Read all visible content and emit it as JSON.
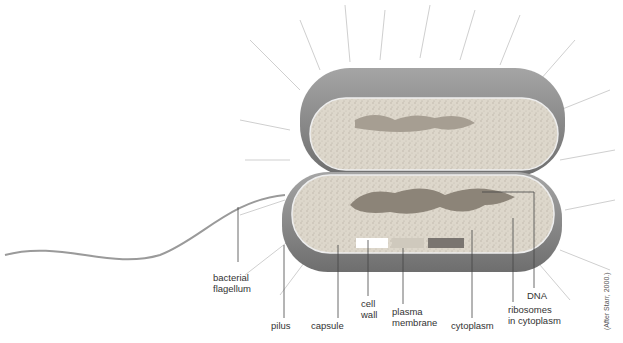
{
  "figure": {
    "credit": "(After Starr, 2000.)",
    "colors": {
      "capsule": "#8a8a8a",
      "cytoplasm": "#d6d0c4",
      "dna": "#8c8478",
      "pili": "#c8c8c8",
      "label_lines": "#444444"
    }
  },
  "labels": {
    "flagellum": "bacterial flagellum",
    "flagellum_l1": "bacterial",
    "flagellum_l2": "flagellum",
    "pilus": "pilus",
    "capsule": "capsule",
    "cell_wall_l1": "cell",
    "cell_wall_l2": "wall",
    "plasma_membrane_l1": "plasma",
    "plasma_membrane_l2": "membrane",
    "cytoplasm": "cytoplasm",
    "ribosomes_l1": "ribosomes",
    "ribosomes_l2": "in cytoplasm",
    "dna": "DNA"
  }
}
